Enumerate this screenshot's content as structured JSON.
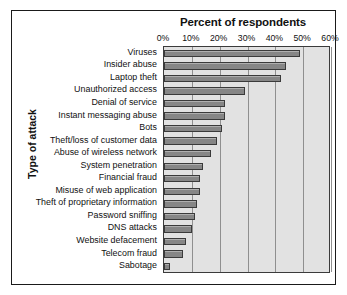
{
  "chart_data": {
    "type": "bar",
    "orientation": "horizontal",
    "title": "Percent of respondents",
    "xlabel": "Percent of respondents",
    "ylabel": "Type of attack",
    "xlim": [
      0,
      60
    ],
    "xtick_labels": [
      "0%",
      "10%",
      "20%",
      "30%",
      "40%",
      "50%",
      "60%"
    ],
    "xtick_values": [
      0,
      10,
      20,
      30,
      40,
      50,
      60
    ],
    "grid": true,
    "legend": false,
    "bar_color": "#8d8d8d",
    "bar_edge_color": "#3a3a3a",
    "plot_background": "#e2e2e2",
    "categories": [
      "Viruses",
      "Insider abuse",
      "Laptop theft",
      "Unauthorized access",
      "Denial of service",
      "Instant messaging abuse",
      "Bots",
      "Theft/loss of customer data",
      "Abuse of wireless network",
      "System penetration",
      "Financial fraud",
      "Misuse of web application",
      "Theft of proprietary information",
      "Password sniffing",
      "DNS attacks",
      "Website defacement",
      "Telecom fraud",
      "Sabotage"
    ],
    "values": [
      49,
      44,
      42,
      29,
      22,
      22,
      21,
      19,
      17,
      14,
      13,
      13,
      12,
      11,
      10,
      8,
      7,
      2
    ]
  }
}
